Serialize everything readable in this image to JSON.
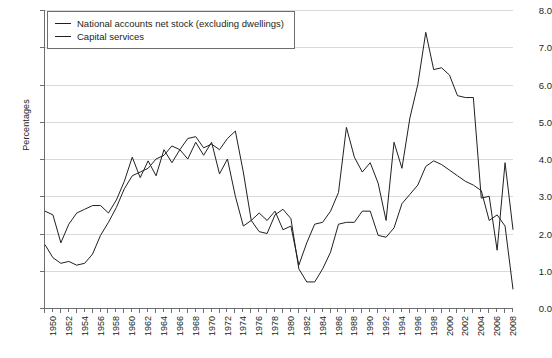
{
  "chart_data": {
    "type": "line",
    "title": "",
    "xlabel": "",
    "ylabel": "Percentages",
    "ylim": [
      0.0,
      8.0
    ],
    "xlim": [
      1950,
      2009
    ],
    "ytick_labels": [
      "0.0",
      "1.0",
      "2.0",
      "3.0",
      "4.0",
      "5.0",
      "6.0",
      "7.0",
      "8.0"
    ],
    "ytick_values": [
      0.0,
      1.0,
      2.0,
      3.0,
      4.0,
      5.0,
      6.0,
      7.0,
      8.0
    ],
    "xtick_labels": [
      "1950",
      "1952",
      "1954",
      "1956",
      "1958",
      "1960",
      "1962",
      "1964",
      "1966",
      "1968",
      "1970",
      "1972",
      "1974",
      "1976",
      "1978",
      "1980",
      "1982",
      "1984",
      "1986",
      "1988",
      "1990",
      "1992",
      "1994",
      "1996",
      "1998",
      "2000",
      "2002",
      "2004",
      "2006",
      "2008"
    ],
    "xtick_values": [
      1950,
      1952,
      1954,
      1956,
      1958,
      1960,
      1962,
      1964,
      1966,
      1968,
      1970,
      1972,
      1974,
      1976,
      1978,
      1980,
      1982,
      1984,
      1986,
      1988,
      1990,
      1992,
      1994,
      1996,
      1998,
      2000,
      2002,
      2004,
      2006,
      2008
    ],
    "grid": true,
    "legend_position": "top-left",
    "x": [
      1950,
      1951,
      1952,
      1953,
      1954,
      1955,
      1956,
      1957,
      1958,
      1959,
      1960,
      1961,
      1962,
      1963,
      1964,
      1965,
      1966,
      1967,
      1968,
      1969,
      1970,
      1971,
      1972,
      1973,
      1974,
      1975,
      1976,
      1977,
      1978,
      1979,
      1980,
      1981,
      1982,
      1983,
      1984,
      1985,
      1986,
      1987,
      1988,
      1989,
      1990,
      1991,
      1992,
      1993,
      1994,
      1995,
      1996,
      1997,
      1998,
      1999,
      2000,
      2001,
      2002,
      2003,
      2004,
      2005,
      2006,
      2007,
      2008,
      2009
    ],
    "series": [
      {
        "name": "National accounts net stock (excluding dwellings)",
        "color": "#231f20",
        "values": [
          1.7,
          1.35,
          1.2,
          1.25,
          1.15,
          1.2,
          1.45,
          1.95,
          2.3,
          2.7,
          3.2,
          3.55,
          3.65,
          3.75,
          4.0,
          4.1,
          4.35,
          4.25,
          4.55,
          4.6,
          4.3,
          4.4,
          4.25,
          4.55,
          4.75,
          3.65,
          2.35,
          2.05,
          2.0,
          2.5,
          2.65,
          2.4,
          1.05,
          0.7,
          0.7,
          1.05,
          1.5,
          2.25,
          2.3,
          2.3,
          2.6,
          2.6,
          1.95,
          1.9,
          2.15,
          2.8,
          3.05,
          3.3,
          3.8,
          3.95,
          3.85,
          3.7,
          3.55,
          3.4,
          3.3,
          3.15,
          2.35,
          2.5,
          2.2,
          0.5
        ]
      },
      {
        "name": "Capital services",
        "color": "#231f20",
        "values": [
          2.6,
          2.5,
          1.75,
          2.25,
          2.55,
          2.65,
          2.75,
          2.75,
          2.55,
          2.9,
          3.4,
          4.05,
          3.5,
          3.95,
          3.55,
          4.25,
          3.9,
          4.25,
          4.0,
          4.45,
          4.1,
          4.45,
          3.6,
          4.0,
          3.0,
          2.2,
          2.35,
          2.55,
          2.35,
          2.6,
          2.1,
          2.2,
          1.15,
          1.75,
          2.25,
          2.3,
          2.6,
          3.1,
          4.85,
          4.05,
          3.65,
          3.9,
          3.35,
          2.35,
          4.45,
          3.75,
          5.1,
          6.0,
          7.4,
          6.4,
          6.45,
          6.25,
          5.7,
          5.65,
          5.65,
          2.95,
          3.0,
          1.55,
          3.9,
          2.1
        ]
      }
    ]
  },
  "legend": {
    "items": [
      {
        "label": "National accounts net stock (excluding dwellings)"
      },
      {
        "label": "Capital services"
      }
    ]
  }
}
